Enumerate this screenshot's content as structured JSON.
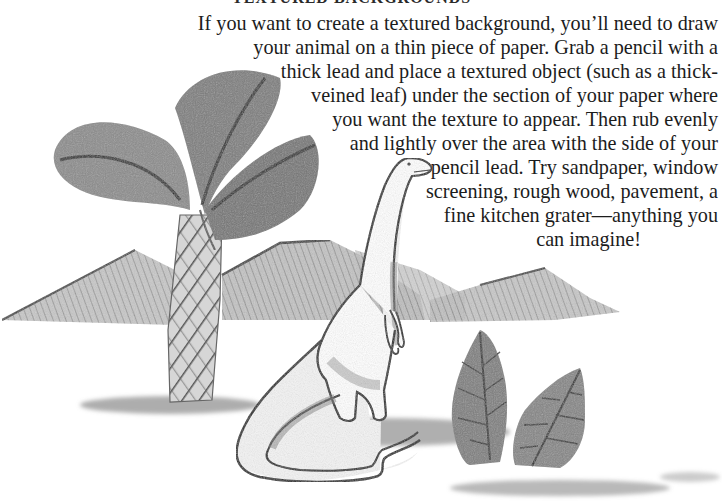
{
  "heading": "TEXTURED BACKGROUNDS",
  "paragraph": {
    "lines": [
      "If you want to create a textured background, you’ll need to draw",
      "your animal on a thin piece of paper. Grab a pencil with a",
      "thick lead and place a textured object (such as a thick-",
      "veined leaf) under the section of your paper where",
      "you want the texture to appear. Then rub evenly",
      "and lightly over the area with the side of your",
      "pencil lead. Try sandpaper, window",
      "screening, rough wood, pavement, a",
      "fine kitchen grater—anything you",
      "can imagine!"
    ],
    "line_right_edges": [
      718,
      718,
      718,
      718,
      718,
      718,
      718,
      718,
      718,
      649
    ]
  },
  "illustration": {
    "subject": "pencil drawing of a long-necked dinosaur beside a palm-like tree, mountains and two leaf rubbings",
    "elements": [
      "palm-tree",
      "mountains",
      "dinosaur",
      "leaf-rubbings",
      "ground-shadow"
    ]
  },
  "colors": {
    "paper": "#ffffff",
    "ink": "#1c1c1c",
    "graphite_dark": "#4a4a4a",
    "graphite_mid": "#8a8a8a",
    "graphite_light": "#c4c4c4"
  }
}
